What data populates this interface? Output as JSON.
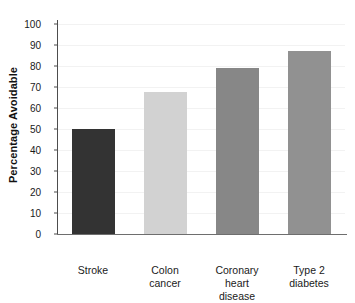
{
  "chart_data": {
    "type": "bar",
    "title": "",
    "xlabel": "",
    "ylabel": "Percentage Avoidable",
    "ylim": [
      0,
      100
    ],
    "yticks": [
      0,
      10,
      20,
      30,
      40,
      50,
      60,
      70,
      80,
      90,
      100
    ],
    "ytick_labels": [
      "0",
      "10",
      "20",
      "30",
      "40",
      "50",
      "60",
      "70",
      "80",
      "90",
      "100"
    ],
    "grid": true,
    "legend": null,
    "categories": [
      "Stroke",
      "Colon cancer",
      "Coronary heart disease",
      "Type 2 diabetes"
    ],
    "category_lines": [
      [
        "Stroke"
      ],
      [
        "Colon",
        "cancer"
      ],
      [
        "Coronary",
        "heart",
        "disease"
      ],
      [
        "Type 2",
        "diabetes"
      ]
    ],
    "values": [
      50,
      67.5,
      79,
      87
    ],
    "bar_colors": [
      "#333333",
      "#d2d2d2",
      "#878787",
      "#919191"
    ],
    "bars": [
      {
        "label": "Stroke",
        "value": 50,
        "color": "#333333"
      },
      {
        "label": "Colon cancer",
        "value": 67.5,
        "color": "#d2d2d2"
      },
      {
        "label": "Coronary heart disease",
        "value": 79,
        "color": "#878787"
      },
      {
        "label": "Type 2 diabetes",
        "value": 87,
        "color": "#919191"
      }
    ]
  },
  "figure": {
    "background": "#ffffff",
    "axis_color": "#4d4d4d",
    "gridline_color": "#f2f2f2"
  }
}
